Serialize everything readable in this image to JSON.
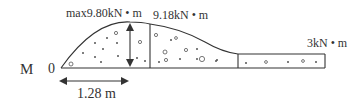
{
  "diagram": {
    "type": "bending-moment-diagram",
    "axis_label": "M",
    "origin_label": "0",
    "max_label": "max9.80kN • m",
    "mid_label": "9.18kN • m",
    "end_label": "3kN • m",
    "dimension_label": "1.28 m",
    "colors": {
      "line": "#333333",
      "background": "#ffffff"
    }
  }
}
